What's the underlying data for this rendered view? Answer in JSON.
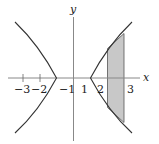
{
  "diagram": {
    "type": "hyperbola-with-shaded-region",
    "equation": "x^2 - y^2 = 1",
    "axes": {
      "x_label": "x",
      "y_label": "y"
    },
    "tick_labels": [
      {
        "value": -3,
        "text": "−3"
      },
      {
        "value": -2,
        "text": "−2"
      },
      {
        "value": -1,
        "text": "−1"
      },
      {
        "value": 1,
        "text": "1"
      },
      {
        "value": 2,
        "text": "2"
      },
      {
        "value": 3,
        "text": "3"
      }
    ],
    "shaded_region": {
      "x_from": 2,
      "x_to": 3,
      "fill": "#c8c8c8"
    },
    "colors": {
      "curve": "#333333",
      "axis": "#888888",
      "shade": "#c8c8c8"
    }
  }
}
